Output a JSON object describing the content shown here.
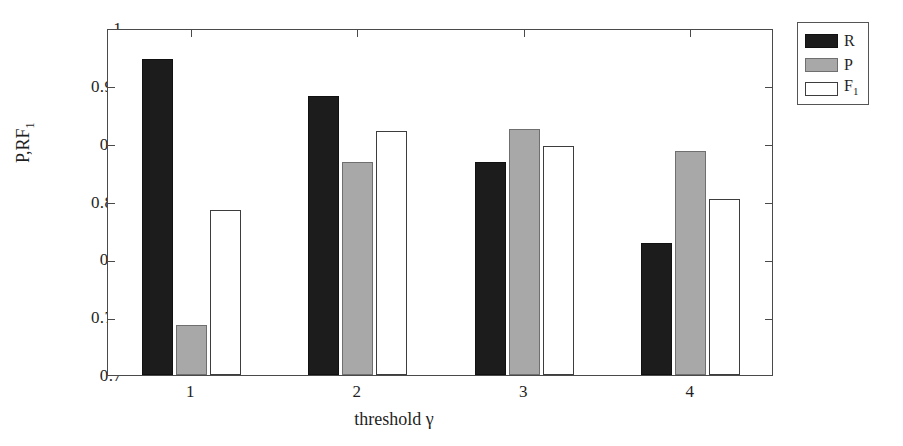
{
  "chart_data": {
    "type": "bar",
    "title": "",
    "xlabel": "threshold γ",
    "ylabel": "P,R,F1",
    "ylabel_main": "P,RF",
    "ylabel_sub": "1",
    "categories": [
      "1",
      "2",
      "3",
      "4"
    ],
    "ylim": [
      0.7,
      1.0
    ],
    "yticks": [
      0.7,
      0.75,
      0.8,
      0.85,
      0.9,
      0.95,
      1.0
    ],
    "ytick_labels": [
      "0.7",
      "0.75",
      "0.8",
      "0.85",
      "0.9",
      "0.95",
      "1"
    ],
    "grid": false,
    "legend_position": "outside-top-right",
    "series": [
      {
        "name": "R",
        "label_main": "R",
        "label_sub": "",
        "color": "#1c1c1c",
        "edge": "#111111",
        "values": [
          0.973,
          0.941,
          0.884,
          0.814
        ]
      },
      {
        "name": "P",
        "label_main": "P",
        "label_sub": "",
        "color": "#a8a8a8",
        "edge": "#6f6f6f",
        "values": [
          0.743,
          0.884,
          0.913,
          0.894
        ]
      },
      {
        "name": "F1",
        "label_main": "F",
        "label_sub": "1",
        "color": "#ffffff",
        "edge": "#3d3d3d",
        "values": [
          0.843,
          0.911,
          0.898,
          0.852
        ]
      }
    ]
  },
  "axes": {
    "y_tick_labels": [
      "1",
      "0.95",
      "0.9",
      "0.85",
      "0.8",
      "0.75",
      "0.7"
    ],
    "x_tick_labels": [
      "1",
      "2",
      "3",
      "4"
    ]
  },
  "legend": {
    "entries": [
      {
        "label_main": "R",
        "label_sub": ""
      },
      {
        "label_main": "P",
        "label_sub": ""
      },
      {
        "label_main": "F",
        "label_sub": "1"
      }
    ]
  }
}
